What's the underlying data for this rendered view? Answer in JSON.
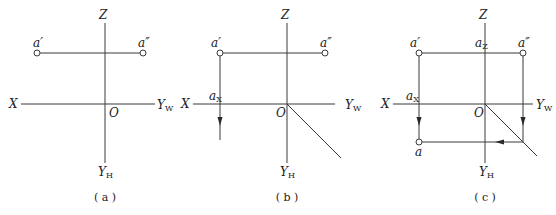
{
  "panels": [
    {
      "id": "a",
      "caption": "( a )",
      "labels": {
        "z": "Z",
        "x": "X",
        "origin": "O",
        "yw": "Y",
        "yw_sub": "W",
        "yh": "Y",
        "yh_sub": "H",
        "a_prime": "a′",
        "a_dprime": "a″"
      }
    },
    {
      "id": "b",
      "caption": "( b )",
      "labels": {
        "z": "Z",
        "x": "X",
        "origin": "O",
        "yw": "Y",
        "yw_sub": "W",
        "yh": "Y",
        "yh_sub": "H",
        "a_prime": "a′",
        "a_dprime": "a″",
        "ax": "a",
        "ax_sub": "X"
      }
    },
    {
      "id": "c",
      "caption": "( c )",
      "labels": {
        "z": "Z",
        "x": "X",
        "origin": "O",
        "yw": "Y",
        "yw_sub": "W",
        "yh": "Y",
        "yh_sub": "H",
        "a_prime": "a′",
        "a_dprime": "a″",
        "ax": "a",
        "ax_sub": "X",
        "az": "a",
        "az_sub": "Z",
        "a": "a"
      }
    }
  ]
}
